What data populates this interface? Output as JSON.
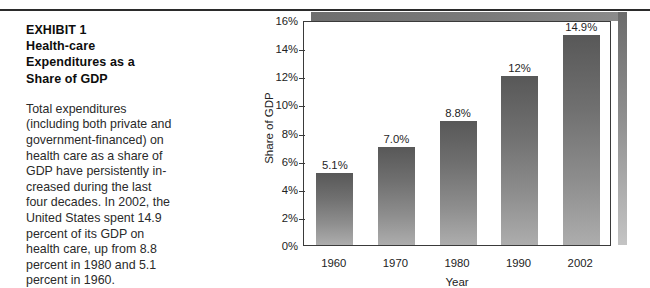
{
  "exhibit": {
    "title_lines": [
      "EXHIBIT 1",
      "Health-care",
      "Expenditures as a",
      "Share of GDP"
    ],
    "body_lines": [
      "Total expenditures",
      "(including both private and",
      "government-financed) on",
      "health care as a share of",
      "GDP have persistently in-",
      "creased during the last",
      "four decades. In 2002, the",
      "United States spent 14.9",
      "percent of its GDP on",
      "health care, up from 8.8",
      "percent in 1980 and 5.1",
      "percent in 1960."
    ]
  },
  "chart_data": {
    "type": "bar",
    "title": "",
    "categories": [
      "1960",
      "1970",
      "1980",
      "1990",
      "2002"
    ],
    "values": [
      5.1,
      7.0,
      8.8,
      12.0,
      14.9
    ],
    "data_labels": [
      "5.1%",
      "7.0%",
      "8.8%",
      "12%",
      "14.9%"
    ],
    "xlabel": "Year",
    "ylabel": "Share of GDP",
    "ylim": [
      0,
      16
    ],
    "ytick_values": [
      0,
      2,
      4,
      6,
      8,
      10,
      12,
      14,
      16
    ],
    "ytick_labels": [
      "0%",
      "2%",
      "4%",
      "6%",
      "8%",
      "10%",
      "12%",
      "14%",
      "16%"
    ],
    "grid": false,
    "legend": false,
    "bar_color_top": "#585858",
    "bar_color_bottom": "#adadad",
    "frame_color": "#3a3a3a",
    "shadow_color": "#6e6e6e"
  }
}
